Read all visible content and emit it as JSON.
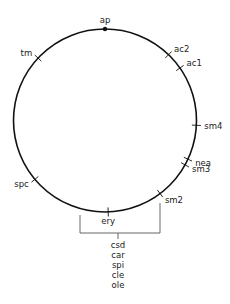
{
  "diagram": {
    "type": "circular-map",
    "origin_marker": {
      "label": "ap",
      "angle_deg": 0
    },
    "markers": [
      {
        "id": "tm",
        "label": "tm",
        "angle_deg": 313,
        "label_side": "outside"
      },
      {
        "id": "ac2",
        "label": "ac2",
        "angle_deg": 44,
        "label_side": "outside"
      },
      {
        "id": "ac1",
        "label": "ac1",
        "angle_deg": 55,
        "label_side": "outside"
      },
      {
        "id": "sm4",
        "label": "sm4",
        "angle_deg": 93,
        "label_side": "outside"
      },
      {
        "id": "nea",
        "label": "nea",
        "angle_deg": 115,
        "label_side": "outside"
      },
      {
        "id": "sm3",
        "label": "sm3",
        "angle_deg": 119,
        "label_side": "outside"
      },
      {
        "id": "sm2",
        "label": "sm2",
        "angle_deg": 143,
        "label_side": "outside"
      },
      {
        "id": "ery",
        "label": "ery",
        "angle_deg": 178,
        "label_side": "inside"
      },
      {
        "id": "spc",
        "label": "spc",
        "angle_deg": 230,
        "label_side": "outside"
      }
    ],
    "bracket_region": {
      "from_marker": "spc",
      "to_marker": "sm2",
      "genes": [
        "csd",
        "car",
        "spi",
        "cle",
        "ole"
      ]
    }
  }
}
